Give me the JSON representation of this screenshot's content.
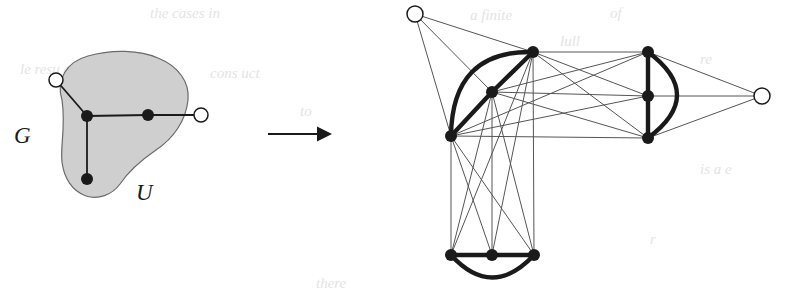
{
  "figure": {
    "background_color": "#ffffff",
    "ink_color": "#1a1a1a",
    "blob_fill_color": "#cfcfcf",
    "blob_stroke_color": "#6a6a6a",
    "thin_edge_color": "#555555",
    "white_node_fill": "#ffffff"
  },
  "labels": {
    "graph_label": "G",
    "subset_label": "U"
  },
  "arrow": {
    "name": "transformation-arrow",
    "x1": 268,
    "y1": 134,
    "x2": 332,
    "y2": 134
  },
  "left_graph": {
    "name": "source-graph-G",
    "blob": {
      "name": "subset-region-U",
      "path": "M 62,100 C 56,80 66,62 88,56 C 112,49 140,50 158,58 C 178,66 190,82 188,100 C 186,120 174,138 156,150 C 140,161 128,172 120,184 C 112,195 98,200 86,196 C 72,191 64,178 62,162 C 60,146 66,128 62,100 Z"
    },
    "black_nodes": [
      {
        "name": "node-u1",
        "x": 87,
        "y": 116,
        "r": 6
      },
      {
        "name": "node-u2",
        "x": 148,
        "y": 115,
        "r": 6
      },
      {
        "name": "node-u3",
        "x": 87,
        "y": 179,
        "r": 6
      }
    ],
    "white_nodes": [
      {
        "name": "node-w1",
        "x": 56,
        "y": 80,
        "r": 7
      },
      {
        "name": "node-w2",
        "x": 201,
        "y": 115,
        "r": 7
      }
    ],
    "edges": [
      {
        "name": "edge-u1-u2",
        "x1": 87,
        "y1": 116,
        "x2": 148,
        "y2": 115
      },
      {
        "name": "edge-u1-u3",
        "x1": 87,
        "y1": 116,
        "x2": 87,
        "y2": 179
      },
      {
        "name": "edge-u1-w1",
        "x1": 87,
        "y1": 116,
        "x2": 56,
        "y2": 80
      },
      {
        "name": "edge-u2-w2",
        "x1": 148,
        "y1": 115,
        "x2": 201,
        "y2": 115
      }
    ]
  },
  "right_graph": {
    "name": "result-graph",
    "white_nodes": [
      {
        "name": "node-white-top-left",
        "x": 415,
        "y": 14,
        "r": 8
      },
      {
        "name": "node-white-right",
        "x": 762,
        "y": 96,
        "r": 8
      }
    ],
    "clusters": [
      {
        "name": "cluster-left-triad",
        "nodes": [
          {
            "name": "node-L1",
            "x": 533,
            "y": 52,
            "r": 6
          },
          {
            "name": "node-L2",
            "x": 492,
            "y": 92,
            "r": 6
          },
          {
            "name": "node-L3",
            "x": 451,
            "y": 136,
            "r": 6
          }
        ]
      },
      {
        "name": "cluster-right-triad",
        "nodes": [
          {
            "name": "node-R1",
            "x": 648,
            "y": 52,
            "r": 6
          },
          {
            "name": "node-R2",
            "x": 648,
            "y": 96,
            "r": 6
          },
          {
            "name": "node-R3",
            "x": 648,
            "y": 138,
            "r": 6
          }
        ]
      },
      {
        "name": "cluster-bottom-triad",
        "nodes": [
          {
            "name": "node-B1",
            "x": 451,
            "y": 255,
            "r": 6
          },
          {
            "name": "node-B2",
            "x": 492,
            "y": 255,
            "r": 6
          },
          {
            "name": "node-B3",
            "x": 534,
            "y": 255,
            "r": 6
          }
        ]
      }
    ],
    "thick_edges": [
      {
        "name": "thick-L1-L2",
        "type": "line",
        "x1": 533,
        "y1": 52,
        "x2": 492,
        "y2": 92
      },
      {
        "name": "thick-L2-L3",
        "type": "line",
        "x1": 492,
        "y1": 92,
        "x2": 451,
        "y2": 136
      },
      {
        "name": "thick-L1-L3-arc",
        "type": "arc",
        "x1": 533,
        "y1": 52,
        "x2": 451,
        "y2": 136,
        "cx": 452,
        "cy": 50
      },
      {
        "name": "thick-R1-R2",
        "type": "line",
        "x1": 648,
        "y1": 52,
        "x2": 648,
        "y2": 96
      },
      {
        "name": "thick-R2-R3",
        "type": "line",
        "x1": 648,
        "y1": 96,
        "x2": 648,
        "y2": 138
      },
      {
        "name": "thick-R1-R3-arc",
        "type": "arc",
        "x1": 648,
        "y1": 52,
        "x2": 648,
        "y2": 138,
        "cx": 706,
        "cy": 95
      },
      {
        "name": "thick-B1-B2",
        "type": "line",
        "x1": 451,
        "y1": 255,
        "x2": 492,
        "y2": 255
      },
      {
        "name": "thick-B2-B3",
        "type": "line",
        "x1": 492,
        "y1": 255,
        "x2": 534,
        "y2": 255
      },
      {
        "name": "thick-B1-B3-arc",
        "type": "arc",
        "x1": 451,
        "y1": 255,
        "x2": 534,
        "y2": 255,
        "cx": 492,
        "cy": 300
      }
    ],
    "thin_edges": [
      {
        "name": "thin-WTL-L1",
        "x1": 415,
        "y1": 14,
        "x2": 533,
        "y2": 52
      },
      {
        "name": "thin-WTL-L2",
        "x1": 415,
        "y1": 14,
        "x2": 492,
        "y2": 92
      },
      {
        "name": "thin-WTL-L3",
        "x1": 415,
        "y1": 14,
        "x2": 451,
        "y2": 136
      },
      {
        "name": "thin-L1-R1",
        "x1": 533,
        "y1": 52,
        "x2": 648,
        "y2": 52
      },
      {
        "name": "thin-L1-R2",
        "x1": 533,
        "y1": 52,
        "x2": 648,
        "y2": 96
      },
      {
        "name": "thin-L1-R3",
        "x1": 533,
        "y1": 52,
        "x2": 648,
        "y2": 138
      },
      {
        "name": "thin-L2-R1",
        "x1": 492,
        "y1": 92,
        "x2": 648,
        "y2": 52
      },
      {
        "name": "thin-L2-R2",
        "x1": 492,
        "y1": 92,
        "x2": 648,
        "y2": 96
      },
      {
        "name": "thin-L2-R3",
        "x1": 492,
        "y1": 92,
        "x2": 648,
        "y2": 138
      },
      {
        "name": "thin-L3-R1",
        "x1": 451,
        "y1": 136,
        "x2": 648,
        "y2": 52
      },
      {
        "name": "thin-L3-R2",
        "x1": 451,
        "y1": 136,
        "x2": 648,
        "y2": 96
      },
      {
        "name": "thin-L3-R3",
        "x1": 451,
        "y1": 136,
        "x2": 648,
        "y2": 138
      },
      {
        "name": "thin-R1-WR",
        "x1": 648,
        "y1": 52,
        "x2": 762,
        "y2": 96
      },
      {
        "name": "thin-R2-WR",
        "x1": 648,
        "y1": 96,
        "x2": 762,
        "y2": 96
      },
      {
        "name": "thin-R3-WR",
        "x1": 648,
        "y1": 138,
        "x2": 762,
        "y2": 96
      },
      {
        "name": "thin-L1-B1",
        "x1": 533,
        "y1": 52,
        "x2": 451,
        "y2": 255
      },
      {
        "name": "thin-L1-B2",
        "x1": 533,
        "y1": 52,
        "x2": 492,
        "y2": 255
      },
      {
        "name": "thin-L1-B3",
        "x1": 533,
        "y1": 52,
        "x2": 534,
        "y2": 255
      },
      {
        "name": "thin-L2-B1",
        "x1": 492,
        "y1": 92,
        "x2": 451,
        "y2": 255
      },
      {
        "name": "thin-L2-B2",
        "x1": 492,
        "y1": 92,
        "x2": 492,
        "y2": 255
      },
      {
        "name": "thin-L2-B3",
        "x1": 492,
        "y1": 92,
        "x2": 534,
        "y2": 255
      },
      {
        "name": "thin-L3-B1",
        "x1": 451,
        "y1": 136,
        "x2": 451,
        "y2": 255
      },
      {
        "name": "thin-L3-B2",
        "x1": 451,
        "y1": 136,
        "x2": 492,
        "y2": 255
      },
      {
        "name": "thin-L3-B3",
        "x1": 451,
        "y1": 136,
        "x2": 534,
        "y2": 255
      }
    ]
  },
  "background_bleed_text": [
    {
      "name": "bleed-1",
      "text": "the cases in",
      "x": 150,
      "y": 6
    },
    {
      "name": "bleed-2",
      "text": "le  resu  e",
      "x": 20,
      "y": 62
    },
    {
      "name": "bleed-3",
      "text": "cons  uct",
      "x": 210,
      "y": 66
    },
    {
      "name": "bleed-4",
      "text": "to",
      "x": 300,
      "y": 104
    },
    {
      "name": "bleed-5",
      "text": "there",
      "x": 316,
      "y": 276
    },
    {
      "name": "bleed-6",
      "text": "a finite",
      "x": 470,
      "y": 8
    },
    {
      "name": "bleed-7",
      "text": "of",
      "x": 610,
      "y": 6
    },
    {
      "name": "bleed-8",
      "text": "lull",
      "x": 560,
      "y": 34
    },
    {
      "name": "bleed-9",
      "text": "re",
      "x": 700,
      "y": 52
    },
    {
      "name": "bleed-10",
      "text": "is  a  e",
      "x": 700,
      "y": 162
    },
    {
      "name": "bleed-11",
      "text": "r",
      "x": 650,
      "y": 232
    }
  ]
}
